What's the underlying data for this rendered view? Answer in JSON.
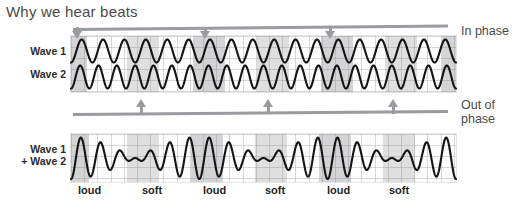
{
  "title": "Why we hear beats",
  "labels": {
    "wave1": "Wave 1",
    "wave2": "Wave 2",
    "sum_line1": "Wave 1",
    "sum_line2": "+ Wave 2"
  },
  "annotations": {
    "in_phase": "In phase",
    "out_of_phase_line1": "Out of",
    "out_of_phase_line2": "phase"
  },
  "beat_labels": [
    {
      "text": "loud",
      "x": 78
    },
    {
      "text": "soft",
      "x": 142
    },
    {
      "text": "loud",
      "x": 203
    },
    {
      "text": "soft",
      "x": 265
    },
    {
      "text": "loud",
      "x": 327
    },
    {
      "text": "soft",
      "x": 389
    }
  ],
  "in_phase_arrows_x": [
    74,
    202,
    327
  ],
  "out_of_phase_arrows_x": [
    138,
    265,
    390
  ],
  "shaded_bands_top": [
    {
      "x": 0,
      "w": 16,
      "kind": "loud"
    },
    {
      "x": 56,
      "w": 32,
      "kind": "soft"
    },
    {
      "x": 122,
      "w": 32,
      "kind": "loud"
    },
    {
      "x": 186,
      "w": 32,
      "kind": "soft"
    },
    {
      "x": 250,
      "w": 32,
      "kind": "loud"
    },
    {
      "x": 314,
      "w": 32,
      "kind": "soft"
    },
    {
      "x": 371,
      "w": 14,
      "kind": "loud"
    }
  ],
  "shaded_bands_bottom": [
    {
      "x": 0,
      "w": 18,
      "kind": "loud"
    },
    {
      "x": 56,
      "w": 32,
      "kind": "soft"
    },
    {
      "x": 120,
      "w": 32,
      "kind": "loud"
    },
    {
      "x": 184,
      "w": 32,
      "kind": "soft"
    },
    {
      "x": 248,
      "w": 32,
      "kind": "loud"
    },
    {
      "x": 312,
      "w": 32,
      "kind": "soft"
    }
  ],
  "colors": {
    "ink": "#1f1f1f",
    "grid": "#aaaaaf",
    "band": "#787880",
    "annotation": "#9a9a9f",
    "title": "#4a4a4a"
  },
  "chart_data": {
    "type": "line",
    "title": "Why we hear beats",
    "xlabel": "",
    "ylabel": "",
    "grid": true,
    "legend": "none",
    "panels": [
      {
        "name": "source-waves",
        "xlim": [
          0,
          1
        ],
        "ylim": [
          -1,
          1
        ],
        "series": [
          {
            "name": "Wave 1",
            "type": "sine",
            "cycles": 18,
            "amplitude": 1.0,
            "phase": 0
          },
          {
            "name": "Wave 2",
            "type": "sine",
            "cycles": 21,
            "amplitude": 1.0,
            "phase": 0
          }
        ],
        "annotations": [
          {
            "text": "In phase",
            "arrow": "down",
            "x_fraction": [
              0.0,
              0.34,
              0.665
            ]
          },
          {
            "text": "Out of phase",
            "arrow": "up",
            "x_fraction": [
              0.17,
              0.503,
              0.828
            ]
          }
        ]
      },
      {
        "name": "superposition",
        "xlim": [
          0,
          1
        ],
        "ylim": [
          -2,
          2
        ],
        "series": [
          {
            "name": "Wave 1 + Wave 2",
            "type": "sum-of-sines",
            "cycles": [
              18,
              21
            ],
            "beat_count": 3,
            "amplitude": 2.0
          }
        ],
        "annotations": [
          {
            "text": "loud",
            "x_fraction": 0.02
          },
          {
            "text": "soft",
            "x_fraction": 0.185
          },
          {
            "text": "loud",
            "x_fraction": 0.345
          },
          {
            "text": "soft",
            "x_fraction": 0.505
          },
          {
            "text": "loud",
            "x_fraction": 0.665
          },
          {
            "text": "soft",
            "x_fraction": 0.826
          }
        ]
      }
    ]
  }
}
